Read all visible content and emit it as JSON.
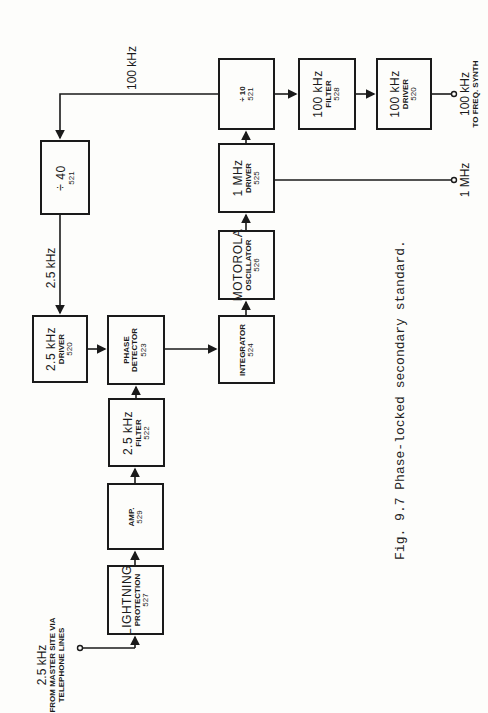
{
  "blocks": {
    "div40": {
      "line1": "÷ 40",
      "number": "521"
    },
    "driver_2_5": {
      "line1": "2.5 kHz",
      "line2": "DRIVER",
      "number": "520"
    },
    "phase_detector": {
      "line1": "PHASE",
      "line2": "DETECTOR",
      "number": "523"
    },
    "filter_2_5": {
      "line1": "2.5 kHz",
      "line2": "FILTER",
      "number": "522"
    },
    "amp": {
      "line1": "AMP.",
      "number": "529"
    },
    "lightning": {
      "line1": "LIGHTNING",
      "line2": "PROTECTION",
      "number": "527"
    },
    "integrator": {
      "line1": "INTEGRATOR",
      "number": "524"
    },
    "oscillator": {
      "line1": "MOTOROLA",
      "line2": "OSCILLATOR",
      "number": "526"
    },
    "driver_1mhz": {
      "line1": "1 MHz",
      "line2": "DRIVER",
      "number": "525"
    },
    "div10": {
      "line1": "÷ 10",
      "number": "521"
    },
    "filter_100k": {
      "line1": "100 kHz",
      "line2": "FILTER",
      "number": "528"
    },
    "driver_100k": {
      "line1": "100 kHz",
      "line2": "DRIVER",
      "number": "520"
    }
  },
  "labels": {
    "input_freq": "2.5 kHz",
    "input_line1": "FROM MASTER SITE VIA",
    "input_line2": "TELEPHONE LINES",
    "feedback_100k": "100 kHz",
    "signal_2_5": "2.5 kHz",
    "output_1mhz": "1 MHz",
    "output_100k_freq": "100 kHz",
    "output_100k_dest": "TO FREQ. SYNTH"
  },
  "caption": "Fig. 9.7  Phase-locked secondary standard.",
  "colors": {
    "ink": "#1a1a1a",
    "paper": "#fdfdfb"
  }
}
